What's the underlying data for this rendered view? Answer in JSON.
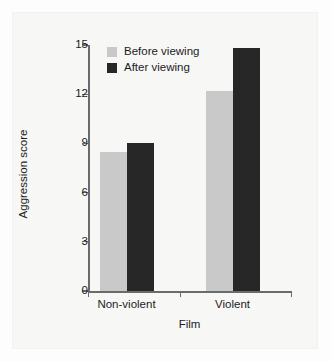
{
  "chart_data": {
    "type": "bar",
    "title": "",
    "subtitle": "",
    "xlabel": "Film",
    "ylabel": "Aggression score",
    "categories": [
      "Non-violent",
      "Violent"
    ],
    "series": [
      {
        "name": "Before viewing",
        "color": "#c9c9c9",
        "values": [
          8.5,
          12.2
        ]
      },
      {
        "name": "After viewing",
        "color": "#272727",
        "values": [
          9.0,
          14.8
        ]
      }
    ],
    "ylim": [
      0,
      15
    ],
    "yticks": [
      0,
      3,
      6,
      9,
      12,
      15
    ],
    "ytick_labels": [
      "0",
      "3",
      "6",
      "9",
      "12",
      "15"
    ],
    "grid": false,
    "legend_position": "top-left-inside",
    "background_color": "#f7f7f6",
    "axis_color": "#6b6b6b",
    "text_color": "#1d1d1d"
  },
  "axes": {
    "y_title": "Aggression score",
    "x_title": "Film"
  },
  "legend": {
    "items": [
      {
        "label": "Before viewing",
        "swatch": "legend-swatch-before"
      },
      {
        "label": "After viewing",
        "swatch": "legend-swatch-after"
      }
    ]
  }
}
